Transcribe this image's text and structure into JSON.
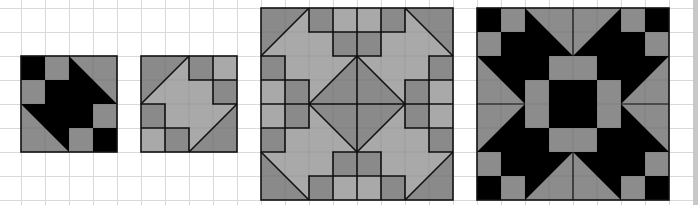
{
  "colors": {
    "background": "#ffffff",
    "grid_line": "#d9d9d9",
    "black": "#000000",
    "dark_gray": "#8a8a8a",
    "light_gray": "#a9a9a9",
    "mid_gray": "#8c8c8c",
    "outline": "#111111",
    "scrollbar": "#c8c8c8"
  },
  "grid": {
    "cell_size": 24,
    "origin_x": -3,
    "origin_y": 8
  },
  "blocks": [
    {
      "id": "block-1",
      "label": "Small black and gray block",
      "x": 21,
      "y": 56,
      "cells": 4,
      "scheme": "black-gray"
    },
    {
      "id": "block-2",
      "label": "Small gray arrow block",
      "x": 141,
      "y": 56,
      "cells": 4,
      "scheme": "gray-gray"
    },
    {
      "id": "block-3",
      "label": "Large gray block (4 mirrored copies of block 2)",
      "x": 261,
      "y": 8,
      "cells": 8,
      "scheme": "gray-gray"
    },
    {
      "id": "block-4",
      "label": "Large black star block (4 mirrored copies of block 1)",
      "x": 477,
      "y": 8,
      "cells": 8,
      "scheme": "black-gray"
    }
  ]
}
